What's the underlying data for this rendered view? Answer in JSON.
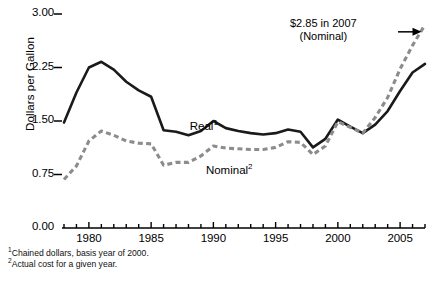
{
  "chart_data": {
    "type": "line",
    "title": "",
    "xlabel": "",
    "ylabel": "Dollars per Gallon",
    "xlim": [
      1978,
      2007
    ],
    "ylim": [
      0.0,
      3.0
    ],
    "yticks": [
      "0.00",
      "0.75",
      "1.50",
      "2.25",
      "3.00"
    ],
    "ytick_values": [
      0.0,
      0.75,
      1.5,
      2.25,
      3.0
    ],
    "xticks": [
      "1980",
      "1985",
      "1990",
      "1995",
      "2000",
      "2005"
    ],
    "xtick_values": [
      1980,
      1985,
      1990,
      1995,
      2000,
      2005
    ],
    "x": [
      1978,
      1979,
      1980,
      1981,
      1982,
      1983,
      1984,
      1985,
      1986,
      1987,
      1988,
      1989,
      1990,
      1991,
      1992,
      1993,
      1994,
      1995,
      1996,
      1997,
      1998,
      1999,
      2000,
      2001,
      2002,
      2003,
      2004,
      2005,
      2006,
      2007
    ],
    "grid": false,
    "legend_position": "inline",
    "series": [
      {
        "name": "Real",
        "label": "Real",
        "footnote_marker": "1",
        "style": "solid",
        "color": "#1a1a1a",
        "values": [
          1.48,
          1.9,
          2.25,
          2.33,
          2.22,
          2.05,
          1.93,
          1.84,
          1.37,
          1.35,
          1.3,
          1.36,
          1.5,
          1.4,
          1.36,
          1.33,
          1.31,
          1.33,
          1.38,
          1.35,
          1.13,
          1.25,
          1.52,
          1.42,
          1.33,
          1.45,
          1.64,
          1.92,
          2.18,
          2.3
        ]
      },
      {
        "name": "Nominal",
        "label": "Nominal",
        "footnote_marker": "2",
        "style": "dashed",
        "color": "#8c8c8c",
        "values": [
          0.68,
          0.87,
          1.22,
          1.36,
          1.3,
          1.22,
          1.19,
          1.18,
          0.88,
          0.92,
          0.92,
          1.01,
          1.15,
          1.12,
          1.11,
          1.1,
          1.1,
          1.13,
          1.21,
          1.2,
          1.03,
          1.15,
          1.49,
          1.41,
          1.33,
          1.55,
          1.83,
          2.23,
          2.56,
          2.85
        ]
      }
    ],
    "annotations": [
      {
        "name": "peak-callout",
        "line1": "$2.85 in 2007",
        "line2": "(Nominal)",
        "arrow": "right-arrow",
        "target_x": 2007,
        "target_y": 2.85
      }
    ],
    "footnotes": [
      {
        "marker": "1",
        "text": "Chained dollars, basis year of 2000."
      },
      {
        "marker": "2",
        "text": "Actual cost for a given year."
      }
    ]
  },
  "axis_colors": {
    "axis": "#000000",
    "real_line": "#1a1a1a",
    "nominal_line": "#8c8c8c",
    "background": "#ffffff"
  }
}
